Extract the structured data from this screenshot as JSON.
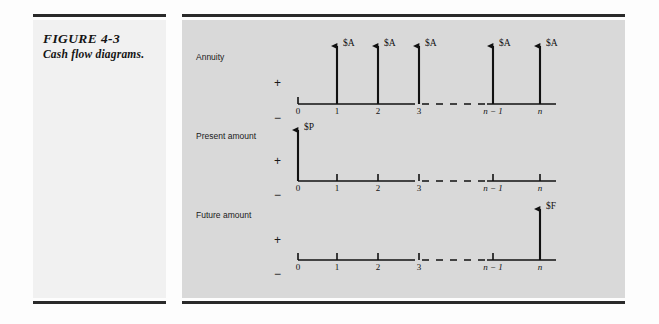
{
  "figure": {
    "number": "FIGURE 4-3",
    "title": "Cash flow diagrams."
  },
  "colors": {
    "page_background": "#fdfdfd",
    "caption_panel_background": "#f1f1f1",
    "figure_panel_background": "#d9d9d9",
    "rule": "#2a2a2a",
    "ink": "#111111"
  },
  "axis": {
    "tick_labels": [
      "0",
      "1",
      "2",
      "3",
      "n − 1",
      "n"
    ],
    "positive_sign": "+",
    "negative_sign": "−",
    "gap_between": [
      "3",
      "n − 1"
    ],
    "gap_style": "dashed"
  },
  "diagrams": [
    {
      "label": "Annuity",
      "sign_plus": "+",
      "sign_minus": "−",
      "ticks": [
        "0",
        "1",
        "2",
        "3",
        "n − 1",
        "n"
      ],
      "arrows": [
        {
          "at": "1",
          "direction": "up",
          "amount": "$A"
        },
        {
          "at": "2",
          "direction": "up",
          "amount": "$A"
        },
        {
          "at": "3",
          "direction": "up",
          "amount": "$A"
        },
        {
          "at": "n − 1",
          "direction": "up",
          "amount": "$A"
        },
        {
          "at": "n",
          "direction": "up",
          "amount": "$A"
        }
      ]
    },
    {
      "label": "Present amount",
      "sign_plus": "+",
      "sign_minus": "−",
      "ticks": [
        "0",
        "1",
        "2",
        "3",
        "n − 1",
        "n"
      ],
      "arrows": [
        {
          "at": "0",
          "direction": "up",
          "amount": "$P"
        }
      ]
    },
    {
      "label": "Future amount",
      "sign_plus": "+",
      "sign_minus": "−",
      "ticks": [
        "0",
        "1",
        "2",
        "3",
        "n − 1",
        "n"
      ],
      "arrows": [
        {
          "at": "n",
          "direction": "up",
          "amount": "$F"
        }
      ]
    }
  ],
  "amount_symbols": {
    "annuity": "$A",
    "present": "$P",
    "future": "$F"
  }
}
